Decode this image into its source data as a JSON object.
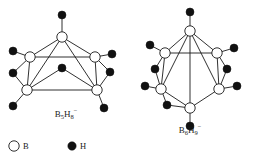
{
  "figure": {
    "type": "chemical-structure-diagram",
    "background_color": "#ffffff",
    "line_color": "#1a1a1a",
    "boron_fill": "#ffffff",
    "hydrogen_fill": "#111111",
    "width": 255,
    "height": 155
  },
  "structures": [
    {
      "id": "left",
      "label_base1": "B",
      "label_sub1": "5",
      "label_base2": "H",
      "label_sub2": "8",
      "label_charge": "−",
      "label_plain": "B5H8-",
      "label_x": 66,
      "label_y": 117,
      "description": "square pyramidal B5 cage with terminal and bridging hydrogens",
      "boron_atoms": [
        {
          "name": "b-apex",
          "x": 62,
          "y": 37,
          "r": 5.2
        },
        {
          "name": "b-upper-left",
          "x": 30,
          "y": 57,
          "r": 5.2
        },
        {
          "name": "b-upper-right",
          "x": 95,
          "y": 57,
          "r": 5.2
        },
        {
          "name": "b-lower-left",
          "x": 27,
          "y": 90,
          "r": 5.2
        },
        {
          "name": "b-lower-right",
          "x": 97,
          "y": 90,
          "r": 5.2
        }
      ],
      "hydrogen_atoms": [
        {
          "name": "h-apex-terminal",
          "x": 62,
          "y": 15,
          "r": 4.0
        },
        {
          "name": "h-upper-left-terminal",
          "x": 13,
          "y": 51,
          "r": 4.0
        },
        {
          "name": "h-upper-right-terminal",
          "x": 112,
          "y": 54,
          "r": 4.0
        },
        {
          "name": "h-bridge-center",
          "x": 62,
          "y": 68,
          "r": 4.0
        },
        {
          "name": "h-bridge-left",
          "x": 13,
          "y": 73,
          "r": 4.0
        },
        {
          "name": "h-bridge-right",
          "x": 110,
          "y": 72,
          "r": 4.0
        },
        {
          "name": "h-lower-left-terminal",
          "x": 13,
          "y": 106,
          "r": 4.0
        },
        {
          "name": "h-lower-right-terminal",
          "x": 104,
          "y": 108,
          "r": 4.0
        }
      ],
      "bonds": [
        {
          "name": "bond-apex-upperleft",
          "x1": 62,
          "y1": 37,
          "x2": 30,
          "y2": 57
        },
        {
          "name": "bond-apex-upperright",
          "x1": 62,
          "y1": 37,
          "x2": 95,
          "y2": 57
        },
        {
          "name": "bond-apex-lowerleft",
          "x1": 62,
          "y1": 37,
          "x2": 27,
          "y2": 90
        },
        {
          "name": "bond-apex-lowerright",
          "x1": 62,
          "y1": 37,
          "x2": 97,
          "y2": 90
        },
        {
          "name": "bond-upperleft-upperright",
          "x1": 30,
          "y1": 57,
          "x2": 95,
          "y2": 57
        },
        {
          "name": "bond-upperleft-lowerleft",
          "x1": 30,
          "y1": 57,
          "x2": 27,
          "y2": 90
        },
        {
          "name": "bond-upperright-lowerright",
          "x1": 95,
          "y1": 57,
          "x2": 97,
          "y2": 90
        },
        {
          "name": "bond-lowerleft-lowerright",
          "x1": 27,
          "y1": 90,
          "x2": 97,
          "y2": 90
        },
        {
          "name": "bond-apex-h-terminal",
          "x1": 62,
          "y1": 37,
          "x2": 62,
          "y2": 15
        },
        {
          "name": "bond-upperleft-h-terminal",
          "x1": 30,
          "y1": 57,
          "x2": 13,
          "y2": 51
        },
        {
          "name": "bond-upperright-h-terminal",
          "x1": 95,
          "y1": 57,
          "x2": 112,
          "y2": 54
        },
        {
          "name": "bond-upperleft-hbridge-left",
          "x1": 30,
          "y1": 57,
          "x2": 13,
          "y2": 73
        },
        {
          "name": "bond-lowerleft-hbridge-left",
          "x1": 27,
          "y1": 90,
          "x2": 13,
          "y2": 73
        },
        {
          "name": "bond-upperright-hbridge-right",
          "x1": 95,
          "y1": 57,
          "x2": 110,
          "y2": 72
        },
        {
          "name": "bond-lowerright-hbridge-right",
          "x1": 97,
          "y1": 90,
          "x2": 110,
          "y2": 72
        },
        {
          "name": "bond-hbridge-center-lowerleft",
          "x1": 62,
          "y1": 68,
          "x2": 27,
          "y2": 90
        },
        {
          "name": "bond-hbridge-center-lowerright",
          "x1": 62,
          "y1": 68,
          "x2": 97,
          "y2": 90
        },
        {
          "name": "bond-lowerleft-h-terminal",
          "x1": 27,
          "y1": 90,
          "x2": 13,
          "y2": 106
        },
        {
          "name": "bond-lowerright-h-terminal",
          "x1": 97,
          "y1": 90,
          "x2": 104,
          "y2": 108
        }
      ]
    },
    {
      "id": "right",
      "label_base1": "B",
      "label_sub1": "6",
      "label_base2": "H",
      "label_sub2": "9",
      "label_charge": "−",
      "label_plain": "B6H9-",
      "label_x": 190,
      "label_y": 133,
      "description": "octahedral B6 cage with terminal and bridging hydrogens",
      "boron_atoms": [
        {
          "name": "b-top",
          "x": 190,
          "y": 31,
          "r": 5.2
        },
        {
          "name": "b-upper-left",
          "x": 165,
          "y": 53,
          "r": 5.2
        },
        {
          "name": "b-upper-right",
          "x": 217,
          "y": 53,
          "r": 5.2
        },
        {
          "name": "b-lower-left",
          "x": 161,
          "y": 89,
          "r": 5.2
        },
        {
          "name": "b-lower-right",
          "x": 219,
          "y": 89,
          "r": 5.2
        },
        {
          "name": "b-bottom",
          "x": 190,
          "y": 108,
          "r": 5.2
        }
      ],
      "hydrogen_atoms": [
        {
          "name": "h-top-terminal",
          "x": 190,
          "y": 12,
          "r": 4.0
        },
        {
          "name": "h-upper-left-terminal",
          "x": 150,
          "y": 45,
          "r": 4.0
        },
        {
          "name": "h-upper-right-terminal",
          "x": 234,
          "y": 48,
          "r": 4.0
        },
        {
          "name": "h-bridge-upper-left",
          "x": 155,
          "y": 69,
          "r": 4.0
        },
        {
          "name": "h-bridge-upper-right",
          "x": 227,
          "y": 69,
          "r": 4.0
        },
        {
          "name": "h-lower-left-terminal",
          "x": 145,
          "y": 86,
          "r": 4.0
        },
        {
          "name": "h-lower-right-terminal",
          "x": 237,
          "y": 86,
          "r": 4.0
        },
        {
          "name": "h-bridge-lower-left",
          "x": 167,
          "y": 105,
          "r": 4.0
        },
        {
          "name": "h-bottom-terminal",
          "x": 190,
          "y": 126,
          "r": 4.0
        }
      ],
      "bonds": [
        {
          "name": "bond-top-upperleft",
          "x1": 190,
          "y1": 31,
          "x2": 165,
          "y2": 53
        },
        {
          "name": "bond-top-upperright",
          "x1": 190,
          "y1": 31,
          "x2": 217,
          "y2": 53
        },
        {
          "name": "bond-top-lowerleft",
          "x1": 190,
          "y1": 31,
          "x2": 161,
          "y2": 89
        },
        {
          "name": "bond-top-lowerright",
          "x1": 190,
          "y1": 31,
          "x2": 219,
          "y2": 89
        },
        {
          "name": "bond-top-bottom",
          "x1": 190,
          "y1": 31,
          "x2": 190,
          "y2": 108
        },
        {
          "name": "bond-upperleft-upperright",
          "x1": 165,
          "y1": 53,
          "x2": 217,
          "y2": 53
        },
        {
          "name": "bond-upperleft-lowerleft",
          "x1": 165,
          "y1": 53,
          "x2": 161,
          "y2": 89
        },
        {
          "name": "bond-upperright-lowerright",
          "x1": 217,
          "y1": 53,
          "x2": 219,
          "y2": 89
        },
        {
          "name": "bond-lowerleft-bottom",
          "x1": 161,
          "y1": 89,
          "x2": 190,
          "y2": 108
        },
        {
          "name": "bond-lowerright-bottom",
          "x1": 219,
          "y1": 89,
          "x2": 190,
          "y2": 108
        },
        {
          "name": "bond-top-h-terminal",
          "x1": 190,
          "y1": 31,
          "x2": 190,
          "y2": 12
        },
        {
          "name": "bond-upperleft-h-terminal",
          "x1": 165,
          "y1": 53,
          "x2": 150,
          "y2": 45
        },
        {
          "name": "bond-upperright-h-terminal",
          "x1": 217,
          "y1": 53,
          "x2": 234,
          "y2": 48
        },
        {
          "name": "bond-upperleft-hbridge",
          "x1": 165,
          "y1": 53,
          "x2": 155,
          "y2": 69
        },
        {
          "name": "bond-lowerleft-hbridge-upper",
          "x1": 161,
          "y1": 89,
          "x2": 155,
          "y2": 69
        },
        {
          "name": "bond-upperright-hbridge",
          "x1": 217,
          "y1": 53,
          "x2": 227,
          "y2": 69
        },
        {
          "name": "bond-lowerright-hbridge-upper",
          "x1": 219,
          "y1": 89,
          "x2": 227,
          "y2": 69
        },
        {
          "name": "bond-lowerleft-h-terminal",
          "x1": 161,
          "y1": 89,
          "x2": 145,
          "y2": 86
        },
        {
          "name": "bond-lowerright-h-terminal",
          "x1": 219,
          "y1": 89,
          "x2": 237,
          "y2": 86
        },
        {
          "name": "bond-lowerleft-hbridge-lower",
          "x1": 161,
          "y1": 89,
          "x2": 167,
          "y2": 105
        },
        {
          "name": "bond-bottom-hbridge-lower",
          "x1": 190,
          "y1": 108,
          "x2": 167,
          "y2": 105
        },
        {
          "name": "bond-bottom-h-terminal",
          "x1": 190,
          "y1": 108,
          "x2": 190,
          "y2": 126
        }
      ]
    }
  ],
  "legend": {
    "items": [
      {
        "name": "legend-boron",
        "symbol": "open-circle",
        "label": "B",
        "circle_x": 14,
        "circle_y": 146,
        "circle_r": 5.2,
        "text_x": 23,
        "text_y": 149
      },
      {
        "name": "legend-hydrogen",
        "symbol": "filled-circle",
        "label": "H",
        "circle_x": 72,
        "circle_y": 146,
        "circle_r": 4.2,
        "text_x": 80,
        "text_y": 149
      }
    ]
  }
}
